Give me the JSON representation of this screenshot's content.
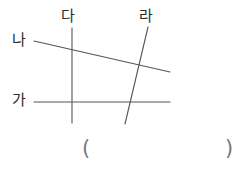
{
  "figure": {
    "type": "line-geometry-diagram",
    "stroke_color": "#555555",
    "label_color": "#2b2b2b",
    "background_color": "#ffffff",
    "lines": [
      {
        "id": "ga",
        "label": "가",
        "orientation": "horizontal",
        "x1": 34,
        "y1": 102,
        "x2": 170,
        "y2": 102
      },
      {
        "id": "na",
        "label": "나",
        "orientation": "slanted-down-right",
        "x1": 34,
        "y1": 41,
        "x2": 170,
        "y2": 72
      },
      {
        "id": "da",
        "label": "다",
        "orientation": "vertical",
        "x1": 72,
        "y1": 28,
        "x2": 72,
        "y2": 123
      },
      {
        "id": "ra",
        "label": "라",
        "orientation": "slanted-down-left",
        "x1": 148,
        "y1": 27,
        "x2": 125,
        "y2": 124
      }
    ]
  },
  "answer_field": {
    "open_paren": "(",
    "close_paren": ")",
    "value": ""
  }
}
